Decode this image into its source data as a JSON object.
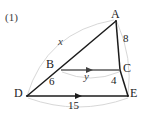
{
  "figure": {
    "problem_number": "(1)",
    "vertices": [
      {
        "name": "A",
        "label": "A",
        "x": 116,
        "y": 20,
        "label_x": 112,
        "label_y": 10
      },
      {
        "name": "B",
        "label": "B",
        "x": 61,
        "y": 70,
        "label_x": 47,
        "label_y": 60
      },
      {
        "name": "C",
        "label": "C",
        "x": 120,
        "y": 70,
        "label_x": 124,
        "label_y": 64
      },
      {
        "name": "D",
        "label": "D",
        "x": 27,
        "y": 96,
        "label_x": 15,
        "label_y": 89
      },
      {
        "name": "E",
        "label": "E",
        "x": 128,
        "y": 96,
        "label_x": 130,
        "label_y": 89
      }
    ],
    "measures": [
      {
        "name": "side-ac-length",
        "text": "8",
        "x": 126,
        "y": 38
      },
      {
        "name": "side-db-length",
        "text": "6",
        "x": 51,
        "y": 81
      },
      {
        "name": "side-ce-length",
        "text": "4",
        "x": 113,
        "y": 79
      },
      {
        "name": "side-de-length",
        "text": "15",
        "x": 72,
        "y": 104
      }
    ],
    "variables": [
      {
        "name": "segment-x-label",
        "text": "x",
        "x": 60,
        "y": 40
      },
      {
        "name": "segment-y-label",
        "text": "y",
        "x": 86,
        "y": 74
      }
    ],
    "colors": {
      "stroke": "#1b1b1b",
      "arrow_line": "#5a5a5a",
      "arc": "#cfcfcf",
      "text": "#1b1b1b"
    }
  }
}
